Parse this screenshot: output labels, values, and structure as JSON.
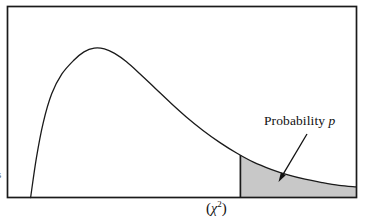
{
  "figure": {
    "background_color": "#ffffff",
    "frame_color": "#1a1a1a",
    "curve_color": "#1a1a1a",
    "shade_color": "#c8c8c8",
    "arrow_color": "#111111"
  },
  "annotation": {
    "text_prefix": "Probability",
    "variable": "p",
    "arrow": "arrow-to-shaded-tail"
  },
  "axis": {
    "x_label_open": "(",
    "x_label_symbol": "χ",
    "x_label_exponent": "2",
    "x_label_close": ")"
  },
  "edge": {
    "fragment": "s"
  },
  "chart_data": {
    "type": "area",
    "title": "",
    "subtitle": "",
    "xlabel": "(χ²)",
    "ylabel": "",
    "grid": false,
    "legend": null,
    "xlim": [
      0,
      1
    ],
    "ylim": [
      0,
      1
    ],
    "series": [
      {
        "name": "chi-square density",
        "style": "line",
        "color": "#1a1a1a",
        "points": [
          [
            0.043,
            0.0
          ],
          [
            0.06,
            0.26
          ],
          [
            0.08,
            0.49
          ],
          [
            0.105,
            0.68
          ],
          [
            0.135,
            0.81
          ],
          [
            0.17,
            0.9
          ],
          [
            0.2,
            0.955
          ],
          [
            0.23,
            0.98
          ],
          [
            0.26,
            0.975
          ],
          [
            0.29,
            0.945
          ],
          [
            0.325,
            0.89
          ],
          [
            0.365,
            0.81
          ],
          [
            0.41,
            0.715
          ],
          [
            0.455,
            0.62
          ],
          [
            0.5,
            0.53
          ],
          [
            0.55,
            0.44
          ],
          [
            0.6,
            0.36
          ],
          [
            0.65,
            0.29
          ],
          [
            0.7,
            0.23
          ],
          [
            0.75,
            0.185
          ],
          [
            0.8,
            0.148
          ],
          [
            0.85,
            0.12
          ],
          [
            0.9,
            0.098
          ],
          [
            0.95,
            0.08
          ],
          [
            1.0,
            0.07
          ]
        ]
      }
    ],
    "shaded_region": {
      "name": "Probability p",
      "fill": "#c8c8c8",
      "x_start": 0.66,
      "x_end": 1.0,
      "boundary_line": "vertical",
      "description": "upper tail area representing the p-value"
    },
    "annotations": [
      {
        "text": "Probability p",
        "x": 0.745,
        "y": 0.525,
        "arrow_to": [
          0.772,
          0.075
        ]
      }
    ]
  }
}
